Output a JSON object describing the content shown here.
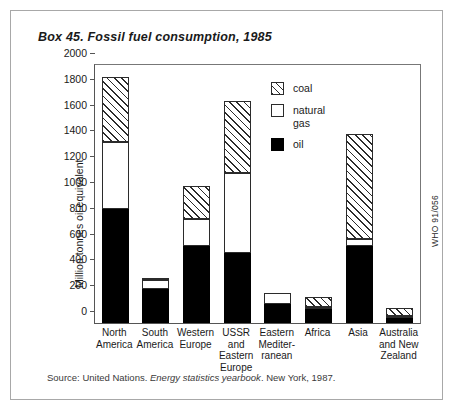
{
  "title": "Box 45. Fossil fuel consumption, 1985",
  "source_note": {
    "prefix": "Source: United Nations. ",
    "italic": "Energy statistics yearbook",
    "suffix": ". New York, 1987."
  },
  "side_code": "WHO 91/056",
  "legend": {
    "position": "inside-top-right",
    "items": [
      {
        "label": "coal",
        "pattern": "diagonal-hatch",
        "color": "#ffffff"
      },
      {
        "label": "natural\ngas",
        "pattern": "solid",
        "color": "#ffffff"
      },
      {
        "label": "oil",
        "pattern": "solid",
        "color": "#000000"
      }
    ]
  },
  "chart_data": {
    "type": "bar",
    "subtype": "stacked",
    "title": "Box 45. Fossil fuel consumption, 1985",
    "xlabel": "",
    "ylabel": "Million tonnes oil equivalent",
    "ylim": [
      0,
      2000
    ],
    "yticks": [
      0,
      200,
      400,
      600,
      800,
      1000,
      1200,
      1400,
      1600,
      1800,
      2000
    ],
    "grid": false,
    "units": "million tonnes oil equivalent",
    "categories": [
      "North\nAmerica",
      "South\nAmerica",
      "Western\nEurope",
      "USSR\nand\nEastern\nEurope",
      "Eastern\nMediter-\nranean",
      "Africa",
      "Asia",
      "Australia\nand New\nZealand"
    ],
    "series": [
      {
        "name": "oil",
        "values": [
          880,
          260,
          600,
          545,
          150,
          105,
          600,
          40
        ]
      },
      {
        "name": "natural gas",
        "values": [
          520,
          70,
          210,
          620,
          85,
          20,
          50,
          15
        ]
      },
      {
        "name": "coal",
        "values": [
          510,
          20,
          250,
          555,
          0,
          75,
          815,
          60
        ]
      }
    ],
    "totals": [
      1910,
      350,
      1060,
      1720,
      235,
      200,
      1465,
      115
    ]
  },
  "y_axis": {
    "ticks": [
      "2000",
      "1800",
      "1600",
      "1400",
      "1200",
      "1000",
      "800",
      "600",
      "400",
      "200",
      "0"
    ]
  }
}
